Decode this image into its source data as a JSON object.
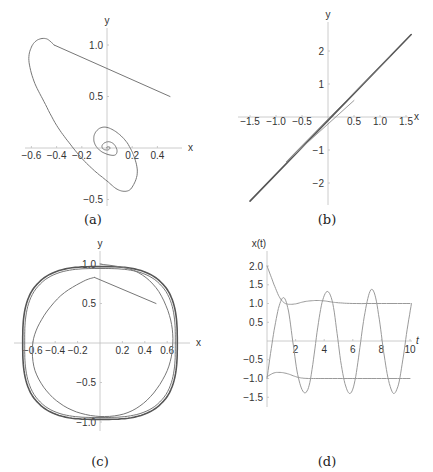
{
  "figure": {
    "captions": [
      "(a)",
      "(b)",
      "(c)",
      "(d)"
    ]
  },
  "colors": {
    "axis": "#bfbfbf",
    "curve_dark": "#555555",
    "curve_mid": "#777777",
    "curve_light": "#9a9a9a",
    "text": "#333333"
  },
  "chart_data": [
    {
      "id": "a",
      "type": "line",
      "title": "",
      "caption": "(a)",
      "xlabel": "x",
      "ylabel": "y",
      "xlim": [
        -0.7,
        0.6
      ],
      "ylim": [
        -0.55,
        1.2
      ],
      "xticks": [
        -0.6,
        -0.4,
        -0.2,
        0.2,
        0.4
      ],
      "xtick_labels": [
        "−0.6",
        "−0.4",
        "−0.2",
        "0.2",
        "0.4"
      ],
      "yticks": [
        -0.5,
        0.5,
        1.0
      ],
      "ytick_labels": [
        "−0.5",
        "0.5",
        "1.0"
      ],
      "grid": false,
      "description": "Phase trajectory spiraling inward to origin (stable focus)",
      "series": [
        {
          "name": "trajectory",
          "points": [
            [
              0.5,
              0.5
            ],
            [
              0.3,
              0.6
            ],
            [
              0.1,
              0.7
            ],
            [
              -0.1,
              0.8
            ],
            [
              -0.3,
              0.92
            ],
            [
              -0.42,
              1.0
            ],
            [
              -0.48,
              1.06
            ],
            [
              -0.55,
              1.05
            ],
            [
              -0.6,
              0.98
            ],
            [
              -0.62,
              0.85
            ],
            [
              -0.58,
              0.65
            ],
            [
              -0.5,
              0.45
            ],
            [
              -0.4,
              0.22
            ],
            [
              -0.3,
              0.05
            ],
            [
              -0.2,
              -0.1
            ],
            [
              -0.1,
              -0.22
            ],
            [
              0.0,
              -0.32
            ],
            [
              0.08,
              -0.4
            ],
            [
              0.15,
              -0.42
            ],
            [
              0.2,
              -0.38
            ],
            [
              0.24,
              -0.25
            ],
            [
              0.22,
              -0.1
            ],
            [
              0.16,
              0.05
            ],
            [
              0.08,
              0.15
            ],
            [
              0.0,
              0.2
            ],
            [
              -0.06,
              0.19
            ],
            [
              -0.1,
              0.13
            ],
            [
              -0.1,
              0.05
            ],
            [
              -0.06,
              -0.02
            ],
            [
              0.0,
              -0.06
            ],
            [
              0.06,
              -0.07
            ],
            [
              0.08,
              -0.03
            ],
            [
              0.06,
              0.03
            ],
            [
              0.02,
              0.06
            ],
            [
              -0.02,
              0.05
            ],
            [
              -0.04,
              0.02
            ],
            [
              -0.03,
              -0.01
            ],
            [
              0.0,
              -0.02
            ],
            [
              0.02,
              -0.01
            ],
            [
              0.02,
              0.01
            ],
            [
              0.0,
              0.01
            ],
            [
              0.0,
              0.0
            ]
          ]
        }
      ]
    },
    {
      "id": "b",
      "type": "line",
      "title": "",
      "caption": "(b)",
      "xlabel": "x",
      "ylabel": "y",
      "xlim": [
        -1.8,
        1.8
      ],
      "ylim": [
        -2.7,
        2.8
      ],
      "xticks": [
        -1.5,
        -1.0,
        -0.5,
        0.5,
        1.0,
        1.5
      ],
      "xtick_labels": [
        "−1.5",
        "−1.0",
        "−0.5",
        "0.5",
        "1.0",
        "1.5"
      ],
      "yticks": [
        -2,
        -1,
        1,
        2
      ],
      "ytick_labels": [
        "−2",
        "−1",
        "1",
        "2"
      ],
      "grid": false,
      "description": "Trajectory collapsing onto a straight line through the origin (diverging along y = 1.6x)",
      "series": [
        {
          "name": "trajectory-start",
          "points": [
            [
              0.5,
              0.5
            ],
            [
              -0.8,
              -1.35
            ]
          ]
        },
        {
          "name": "trajectory-mid",
          "points": [
            [
              -0.8,
              -1.35
            ],
            [
              1.2,
              1.85
            ]
          ]
        },
        {
          "name": "trajectory-main",
          "points": [
            [
              -1.5,
              -2.55
            ],
            [
              1.6,
              2.5
            ]
          ]
        }
      ]
    },
    {
      "id": "c",
      "type": "line",
      "title": "",
      "caption": "(c)",
      "xlabel": "x",
      "ylabel": "y",
      "xlim": [
        -0.75,
        0.75
      ],
      "ylim": [
        -1.1,
        1.1
      ],
      "xticks": [
        -0.6,
        -0.4,
        -0.2,
        0.2,
        0.4,
        0.6
      ],
      "xtick_labels": [
        "−0.6",
        "−0.4",
        "−0.2",
        "0.2",
        "0.4",
        "0.6"
      ],
      "yticks": [
        -1.0,
        -0.5,
        0.5,
        1.0
      ],
      "ytick_labels": [
        "−1.0",
        "−0.5",
        "0.5",
        "1.0"
      ],
      "grid": false,
      "description": "Trajectory from (0.5,0.5) approaching a limit cycle of amplitude ~0.69 in x and ~1.04 in y",
      "limit_cycle": {
        "x_amplitude": 0.69,
        "y_amplitude": 1.04
      },
      "series": [
        {
          "name": "trajectory",
          "start": [
            0.5,
            0.5
          ]
        }
      ]
    },
    {
      "id": "d",
      "type": "line",
      "title": "",
      "caption": "(d)",
      "xlabel": "t",
      "ylabel": "x(t)",
      "xlim": [
        0,
        10.5
      ],
      "ylim": [
        -1.55,
        2.1
      ],
      "xticks": [
        2,
        4,
        6,
        8,
        10
      ],
      "xtick_labels": [
        "2",
        "4",
        "6",
        "8",
        "10"
      ],
      "yticks": [
        -1.5,
        -1.0,
        -0.5,
        0.5,
        1.0,
        1.5,
        2.0
      ],
      "ytick_labels": [
        "−1.5",
        "−1.0",
        "−0.5",
        "0.5",
        "1.0",
        "1.5",
        "2.0"
      ],
      "grid": false,
      "series": [
        {
          "name": "decaying-upper",
          "points": [
            [
              0,
              2.0
            ],
            [
              0.3,
              1.7
            ],
            [
              0.6,
              1.4
            ],
            [
              0.9,
              1.15
            ],
            [
              1.2,
              1.02
            ],
            [
              1.5,
              0.98
            ],
            [
              2.0,
              0.99
            ],
            [
              2.5,
              1.04
            ],
            [
              3.0,
              1.07
            ],
            [
              3.5,
              1.08
            ],
            [
              4.0,
              1.07
            ],
            [
              4.5,
              1.04
            ],
            [
              5.0,
              1.02
            ],
            [
              6.0,
              1.0
            ],
            [
              8.0,
              1.0
            ],
            [
              10.0,
              1.0
            ]
          ]
        },
        {
          "name": "decaying-lower",
          "points": [
            [
              0,
              -0.95
            ],
            [
              0.5,
              -0.85
            ],
            [
              1.0,
              -0.84
            ],
            [
              1.5,
              -0.88
            ],
            [
              2.0,
              -0.95
            ],
            [
              2.5,
              -0.99
            ],
            [
              3.0,
              -1.0
            ],
            [
              4.0,
              -1.0
            ],
            [
              6.0,
              -1.0
            ],
            [
              8.0,
              -1.0
            ],
            [
              10.0,
              -1.0
            ]
          ]
        },
        {
          "name": "oscillation",
          "points": [
            [
              0,
              -1.0
            ],
            [
              0.3,
              -0.2
            ],
            [
              0.6,
              0.5
            ],
            [
              0.9,
              1.0
            ],
            [
              1.2,
              1.15
            ],
            [
              1.5,
              0.8
            ],
            [
              1.8,
              0.0
            ],
            [
              2.1,
              -0.8
            ],
            [
              2.4,
              -1.25
            ],
            [
              2.7,
              -1.38
            ],
            [
              3.0,
              -1.1
            ],
            [
              3.3,
              -0.35
            ],
            [
              3.6,
              0.5
            ],
            [
              3.9,
              1.1
            ],
            [
              4.25,
              1.32
            ],
            [
              4.6,
              1.0
            ],
            [
              4.9,
              0.2
            ],
            [
              5.2,
              -0.65
            ],
            [
              5.5,
              -1.2
            ],
            [
              5.8,
              -1.4
            ],
            [
              6.1,
              -1.15
            ],
            [
              6.4,
              -0.45
            ],
            [
              6.7,
              0.4
            ],
            [
              7.0,
              1.05
            ],
            [
              7.3,
              1.38
            ],
            [
              7.6,
              1.15
            ],
            [
              7.9,
              0.45
            ],
            [
              8.2,
              -0.4
            ],
            [
              8.5,
              -1.05
            ],
            [
              8.85,
              -1.4
            ],
            [
              9.2,
              -1.15
            ],
            [
              9.5,
              -0.5
            ],
            [
              9.8,
              0.3
            ],
            [
              10.1,
              1.0
            ]
          ]
        }
      ]
    }
  ]
}
